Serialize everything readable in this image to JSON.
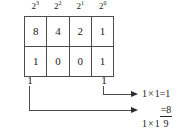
{
  "figure": {
    "background_color": "#ffffff",
    "line_color": "#4d4d4d",
    "text_color": "#1a1a1a"
  },
  "exponent_header": {
    "cells": [
      {
        "base": "2",
        "exponent": "3"
      },
      {
        "base": "2",
        "exponent": "2"
      },
      {
        "base": "2",
        "exponent": "1"
      },
      {
        "base": "2",
        "exponent": "0"
      }
    ]
  },
  "table": {
    "rows": [
      {
        "name": "place-values",
        "cells": [
          "8",
          "4",
          "2",
          "1"
        ]
      },
      {
        "name": "binary-digits",
        "cells": [
          "1",
          "0",
          "0",
          "1"
        ]
      }
    ]
  },
  "under_digits": {
    "msb": "1",
    "lsb": "1"
  },
  "equations": {
    "top": {
      "left": "1",
      "operator": "×",
      "right": "1",
      "equals": "=",
      "result": "1"
    },
    "bottom": {
      "left": "1",
      "operator": "×",
      "right": "1",
      "equals": "=",
      "result": "8",
      "sum": "9"
    }
  }
}
